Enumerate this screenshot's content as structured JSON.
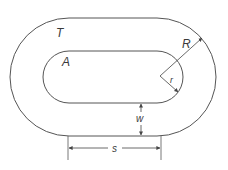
{
  "diagram": {
    "type": "stadium-shaped track / annulus geometry",
    "labels": {
      "outer_region": "T",
      "inner_region": "A",
      "outer_radius": "R",
      "inner_radius": "r",
      "width": "w",
      "straight_length": "s"
    },
    "colors": {
      "stroke": "#555555",
      "text": "#3a3a3a",
      "background": "#ffffff"
    }
  }
}
